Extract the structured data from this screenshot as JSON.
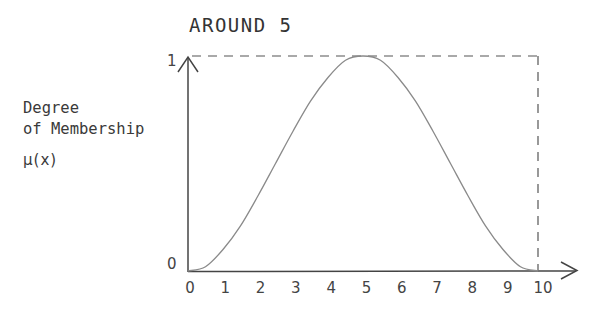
{
  "chart_data": {
    "type": "line",
    "title": "AROUND 5",
    "xlabel": "",
    "ylabel": "Degree of Membership μ(x)",
    "ylabel_lines": [
      "Degree",
      "of Membership",
      "μ(x)"
    ],
    "x_ticks": [
      "0",
      "1",
      "2",
      "3",
      "4",
      "5",
      "6",
      "7",
      "8",
      "9",
      "10"
    ],
    "y_ticks": [
      "0",
      "1"
    ],
    "xlim": [
      0,
      10
    ],
    "ylim": [
      0,
      1
    ],
    "grid": false,
    "legend": null,
    "annotations": [
      "dashed line at y=1 from x=0 to x=10",
      "dashed line at x=10 from y=0 to y=1"
    ],
    "series": [
      {
        "name": "AROUND 5",
        "x": [
          0,
          0.5,
          1,
          1.5,
          2,
          2.5,
          3,
          3.5,
          4,
          4.5,
          5,
          5.5,
          6,
          6.5,
          7,
          7.5,
          8,
          8.5,
          9,
          9.5,
          10
        ],
        "values": [
          0.0,
          0.02,
          0.1,
          0.21,
          0.35,
          0.5,
          0.65,
          0.79,
          0.9,
          0.98,
          1.0,
          0.98,
          0.9,
          0.79,
          0.65,
          0.5,
          0.35,
          0.21,
          0.1,
          0.02,
          0.0
        ]
      }
    ]
  },
  "colors": {
    "axis": "#444444",
    "curve": "#8a8a8a",
    "dashed": "#555555",
    "text": "#3a3a3a"
  }
}
